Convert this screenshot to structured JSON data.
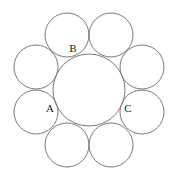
{
  "diagram": {
    "type": "circle-packing",
    "stroke_color": "#7a7a7a",
    "label_color": "#222222",
    "center_circle": {
      "cx": 89,
      "cy": 90,
      "r": 36
    },
    "outer_circles": [
      {
        "id": "top-left",
        "cx": 67,
        "cy": 35,
        "r": 22
      },
      {
        "id": "top-right",
        "cx": 111,
        "cy": 35,
        "r": 22
      },
      {
        "id": "right-upper",
        "cx": 142,
        "cy": 67,
        "r": 22
      },
      {
        "id": "right-lower",
        "cx": 142,
        "cy": 112,
        "r": 22
      },
      {
        "id": "bottom-right",
        "cx": 111,
        "cy": 145,
        "r": 22
      },
      {
        "id": "bottom-left",
        "cx": 67,
        "cy": 145,
        "r": 22
      },
      {
        "id": "left-lower",
        "cx": 36,
        "cy": 112,
        "r": 22
      },
      {
        "id": "left-upper",
        "cx": 36,
        "cy": 67,
        "r": 22
      }
    ],
    "labels": [
      {
        "text": "B",
        "x": 73,
        "y": 52
      },
      {
        "text": "A",
        "x": 50,
        "y": 112
      },
      {
        "text": "C",
        "x": 128,
        "y": 112
      }
    ]
  }
}
